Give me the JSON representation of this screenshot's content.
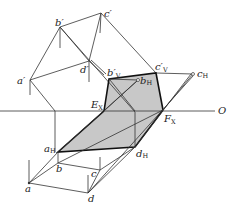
{
  "diagram": {
    "type": "descriptive-geometry-projection",
    "axis_label": "O",
    "labels": {
      "a_prime": "a′",
      "b_prime": "b′",
      "c_prime": "c′",
      "d_prime": "d′",
      "bV_main": "b′",
      "bV_sub": "V",
      "cV_main": "c′",
      "cV_sub": "V",
      "bH_main": "b",
      "bH_sub": "H",
      "cH_main": "c",
      "cH_sub": "H",
      "aH_main": "a",
      "aH_sub": "H",
      "dH_main": "d",
      "dH_sub": "H",
      "EX_main": "E",
      "EX_sub": "X",
      "FX_main": "F",
      "FX_sub": "X",
      "a": "a",
      "b": "b",
      "c": "c",
      "d": "d"
    },
    "colors": {
      "shade": "#c8c8c8",
      "line": "#333333"
    }
  }
}
